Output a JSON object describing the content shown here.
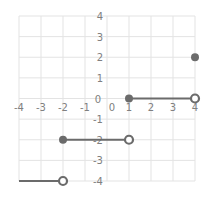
{
  "chart_data": {
    "type": "line",
    "title": "",
    "xlabel": "",
    "ylabel": "",
    "xlim": [
      -4,
      4
    ],
    "ylim": [
      -4,
      4
    ],
    "grid": true,
    "x_ticks": [
      "-4",
      "-3",
      "-2",
      "-1",
      "0",
      "1",
      "2",
      "3",
      "4"
    ],
    "y_ticks": [
      "4",
      "3",
      "2",
      "1",
      "0",
      "-1",
      "-2",
      "-3",
      "-4"
    ],
    "segments": [
      {
        "x1": -4,
        "y1": -4,
        "x2": -2,
        "y2": -4,
        "start": "none",
        "end": "open"
      },
      {
        "x1": -2,
        "y1": -2,
        "x2": 1,
        "y2": -2,
        "start": "closed",
        "end": "open"
      },
      {
        "x1": 1,
        "y1": 0,
        "x2": 4,
        "y2": 0,
        "start": "closed",
        "end": "open"
      }
    ],
    "points": [
      {
        "x": 4,
        "y": 2,
        "style": "closed"
      }
    ],
    "colors": {
      "line": "#6b6b6b",
      "grid": "#e3e3e3",
      "tick": "#808080"
    }
  }
}
